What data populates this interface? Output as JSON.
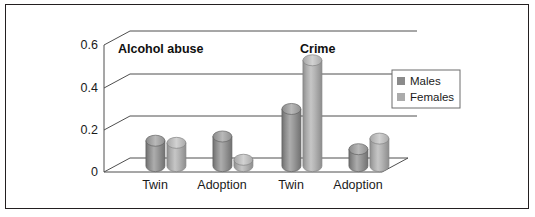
{
  "figure": {
    "border_color": "#231f20",
    "background": "#ffffff"
  },
  "legend": {
    "position": "right",
    "box_border": "#6d6d6d",
    "entries": [
      {
        "label": "Males",
        "color": "#8b8b8b"
      },
      {
        "label": "Females",
        "color": "#ababab"
      }
    ]
  },
  "annotations": {
    "alcohol_abuse": "Alcohol abuse",
    "crime": "Crime"
  },
  "axis": {
    "y_ticks": [
      "0",
      "0.2",
      "0.4",
      "0.6"
    ],
    "x_ticks": [
      "Twin",
      "Adoption",
      "Twin",
      "Adoption"
    ]
  },
  "chart_data": {
    "type": "bar",
    "title": "",
    "subtitle": "",
    "xlabel": "",
    "ylabel": "",
    "ylim": [
      0,
      0.6
    ],
    "ytick_values": [
      0,
      0.2,
      0.4,
      0.6
    ],
    "grid": true,
    "legend_position": "right",
    "style": "3d-cylinder",
    "group_labels": [
      "Alcohol abuse",
      "Crime"
    ],
    "categories": [
      "Twin",
      "Adoption",
      "Twin",
      "Adoption"
    ],
    "series": [
      {
        "name": "Males",
        "color": "#8b8b8b",
        "values": [
          0.12,
          0.14,
          0.27,
          0.08
        ]
      },
      {
        "name": "Females",
        "color": "#ababab",
        "values": [
          0.11,
          0.03,
          0.5,
          0.13
        ]
      }
    ]
  }
}
